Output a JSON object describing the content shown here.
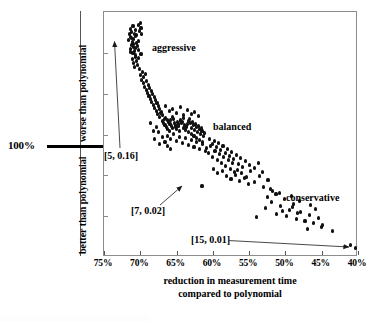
{
  "chart_data": {
    "type": "scatter",
    "title": "",
    "xlabel": "reduction in measurement time compared to polynomial",
    "ylabel_upper": "worse than polynomial",
    "ylabel_lower": "better than polynomial",
    "xlabel_line1": "reduction in measurement time",
    "xlabel_line2": "compared to polynomial",
    "x_tick_labels": [
      "75%",
      "70%",
      "65%",
      "60%",
      "55%",
      "50%",
      "45%",
      "40%"
    ],
    "x_tick_values": [
      75,
      70,
      65,
      60,
      55,
      50,
      45,
      40
    ],
    "xlim": [
      75,
      40
    ],
    "x_axis_reversed": true,
    "y_reference_label": "100%",
    "y_reference_note": "thick horizontal rule marking the 100% (equal to polynomial) level",
    "grid": false,
    "legend": "none",
    "cluster_annotations": [
      {
        "label": "aggressive",
        "x": 68.5,
        "y_px": 47
      },
      {
        "label": "balanced",
        "x": 60.2,
        "y_px": 126
      },
      {
        "label": "conservative",
        "x": 46.0,
        "y_px": 197
      }
    ],
    "point_annotations": [
      {
        "label": "[5, 0.16]",
        "target_x": 71.3,
        "target_y_px": 40,
        "arrow": "up"
      },
      {
        "label": "[7, 0.02]",
        "target_x": 61.5,
        "target_y_px": 185,
        "arrow": "up-right"
      },
      {
        "label": "[15, 0.01]",
        "target_x": 40.3,
        "target_y_px": 247,
        "arrow": "right"
      }
    ],
    "series": [
      {
        "name": "configurations",
        "marker": "filled-circle",
        "color": "#111111",
        "points": [
          [
            71.4,
            28
          ],
          [
            71.2,
            31
          ],
          [
            71.0,
            25
          ],
          [
            70.8,
            33
          ],
          [
            71.3,
            36
          ],
          [
            70.6,
            29
          ],
          [
            71.5,
            33
          ],
          [
            70.9,
            38
          ],
          [
            71.1,
            41
          ],
          [
            70.7,
            35
          ],
          [
            71.6,
            39
          ],
          [
            70.5,
            42
          ],
          [
            71.2,
            44
          ],
          [
            70.9,
            46
          ],
          [
            71.4,
            48
          ],
          [
            70.4,
            45
          ],
          [
            70.8,
            50
          ],
          [
            71.0,
            52
          ],
          [
            70.6,
            54
          ],
          [
            71.3,
            51
          ],
          [
            70.3,
            49
          ],
          [
            70.7,
            56
          ],
          [
            71.1,
            58
          ],
          [
            70.5,
            60
          ],
          [
            70.2,
            57
          ],
          [
            70.9,
            62
          ],
          [
            70.4,
            64
          ],
          [
            70.8,
            66
          ],
          [
            71.0,
            43
          ],
          [
            70.6,
            47
          ],
          [
            71.2,
            37
          ],
          [
            70.5,
            34
          ],
          [
            70.1,
            30
          ],
          [
            69.9,
            27
          ],
          [
            70.3,
            24
          ],
          [
            70.0,
            22
          ],
          [
            69.8,
            33
          ],
          [
            70.2,
            40
          ],
          [
            69.9,
            53
          ],
          [
            70.1,
            68
          ],
          [
            69.7,
            71
          ],
          [
            70.0,
            74
          ],
          [
            69.5,
            76
          ],
          [
            69.8,
            79
          ],
          [
            69.3,
            73
          ],
          [
            69.6,
            82
          ],
          [
            69.1,
            80
          ],
          [
            69.4,
            86
          ],
          [
            68.9,
            84
          ],
          [
            69.2,
            89
          ],
          [
            68.7,
            87
          ],
          [
            69.0,
            92
          ],
          [
            68.5,
            90
          ],
          [
            68.8,
            95
          ],
          [
            68.3,
            93
          ],
          [
            68.6,
            98
          ],
          [
            68.1,
            96
          ],
          [
            68.4,
            101
          ],
          [
            67.9,
            99
          ],
          [
            68.2,
            104
          ],
          [
            67.7,
            102
          ],
          [
            68.0,
            107
          ],
          [
            67.5,
            105
          ],
          [
            67.8,
            110
          ],
          [
            67.3,
            108
          ],
          [
            67.6,
            113
          ],
          [
            67.1,
            111
          ],
          [
            67.4,
            116
          ],
          [
            66.9,
            114
          ],
          [
            67.2,
            112
          ],
          [
            66.7,
            118
          ],
          [
            67.0,
            120
          ],
          [
            66.5,
            117
          ],
          [
            66.8,
            122
          ],
          [
            66.3,
            119
          ],
          [
            66.6,
            124
          ],
          [
            66.1,
            121
          ],
          [
            66.4,
            126
          ],
          [
            65.9,
            123
          ],
          [
            66.2,
            128
          ],
          [
            65.7,
            125
          ],
          [
            66.0,
            130
          ],
          [
            65.5,
            127
          ],
          [
            65.8,
            119
          ],
          [
            65.3,
            122
          ],
          [
            65.6,
            116
          ],
          [
            65.1,
            124
          ],
          [
            65.4,
            118
          ],
          [
            64.9,
            121
          ],
          [
            65.2,
            126
          ],
          [
            64.7,
            123
          ],
          [
            65.0,
            128
          ],
          [
            64.5,
            120
          ],
          [
            64.8,
            125
          ],
          [
            64.3,
            122
          ],
          [
            64.6,
            130
          ],
          [
            64.1,
            127
          ],
          [
            64.4,
            119
          ],
          [
            63.9,
            124
          ],
          [
            64.2,
            121
          ],
          [
            63.7,
            126
          ],
          [
            64.0,
            117
          ],
          [
            63.5,
            123
          ],
          [
            63.8,
            129
          ],
          [
            63.3,
            120
          ],
          [
            63.6,
            125
          ],
          [
            63.1,
            122
          ],
          [
            63.4,
            131
          ],
          [
            62.9,
            127
          ],
          [
            63.2,
            118
          ],
          [
            62.7,
            124
          ],
          [
            63.0,
            133
          ],
          [
            62.5,
            129
          ],
          [
            62.8,
            121
          ],
          [
            62.3,
            126
          ],
          [
            62.6,
            135
          ],
          [
            62.1,
            131
          ],
          [
            62.4,
            123
          ],
          [
            61.9,
            128
          ],
          [
            62.2,
            137
          ],
          [
            61.7,
            133
          ],
          [
            62.0,
            125
          ],
          [
            61.5,
            130
          ],
          [
            61.8,
            139
          ],
          [
            61.3,
            135
          ],
          [
            61.6,
            127
          ],
          [
            61.1,
            132
          ],
          [
            61.4,
            141
          ],
          [
            66.5,
            105
          ],
          [
            66.0,
            110
          ],
          [
            65.5,
            108
          ],
          [
            65.0,
            112
          ],
          [
            64.5,
            106
          ],
          [
            64.0,
            114
          ],
          [
            63.5,
            109
          ],
          [
            63.0,
            113
          ],
          [
            62.5,
            111
          ],
          [
            62.0,
            115
          ],
          [
            66.2,
            135
          ],
          [
            65.8,
            138
          ],
          [
            65.4,
            133
          ],
          [
            65.0,
            140
          ],
          [
            64.6,
            136
          ],
          [
            64.2,
            142
          ],
          [
            63.8,
            137
          ],
          [
            63.4,
            144
          ],
          [
            63.0,
            139
          ],
          [
            62.6,
            146
          ],
          [
            62.2,
            141
          ],
          [
            61.8,
            148
          ],
          [
            61.4,
            143
          ],
          [
            61.0,
            150
          ],
          [
            67.5,
            131
          ],
          [
            67.0,
            136
          ],
          [
            66.6,
            141
          ],
          [
            66.2,
            145
          ],
          [
            65.8,
            148
          ],
          [
            67.8,
            126
          ],
          [
            68.2,
            130
          ],
          [
            68.6,
            122
          ],
          [
            68.0,
            138
          ],
          [
            67.4,
            143
          ],
          [
            60.9,
            147
          ],
          [
            60.6,
            152
          ],
          [
            60.3,
            145
          ],
          [
            60.0,
            156
          ],
          [
            59.7,
            150
          ],
          [
            59.4,
            159
          ],
          [
            59.1,
            153
          ],
          [
            58.8,
            162
          ],
          [
            58.5,
            156
          ],
          [
            58.2,
            165
          ],
          [
            57.9,
            159
          ],
          [
            57.6,
            168
          ],
          [
            57.3,
            162
          ],
          [
            57.0,
            171
          ],
          [
            60.4,
            138
          ],
          [
            60.1,
            143
          ],
          [
            59.8,
            140
          ],
          [
            59.5,
            146
          ],
          [
            59.2,
            142
          ],
          [
            58.9,
            149
          ],
          [
            58.6,
            145
          ],
          [
            58.3,
            152
          ],
          [
            58.0,
            148
          ],
          [
            57.7,
            155
          ],
          [
            57.4,
            151
          ],
          [
            57.1,
            158
          ],
          [
            56.8,
            154
          ],
          [
            56.5,
            163
          ],
          [
            56.2,
            157
          ],
          [
            55.9,
            166
          ],
          [
            61.5,
            185
          ],
          [
            59.9,
            168
          ],
          [
            59.3,
            172
          ],
          [
            58.7,
            170
          ],
          [
            58.1,
            175
          ],
          [
            57.5,
            178
          ],
          [
            56.9,
            174
          ],
          [
            56.3,
            180
          ],
          [
            55.7,
            177
          ],
          [
            55.1,
            183
          ],
          [
            56.6,
            169
          ],
          [
            56.0,
            172
          ],
          [
            55.4,
            176
          ],
          [
            54.8,
            170
          ],
          [
            54.2,
            181
          ],
          [
            53.6,
            175
          ],
          [
            53.0,
            186
          ],
          [
            52.4,
            179
          ],
          [
            51.8,
            190
          ],
          [
            55.5,
            160
          ],
          [
            54.9,
            164
          ],
          [
            54.3,
            167
          ],
          [
            53.7,
            162
          ],
          [
            53.1,
            171
          ],
          [
            52.5,
            196
          ],
          [
            51.9,
            201
          ],
          [
            51.3,
            193
          ],
          [
            50.7,
            205
          ],
          [
            50.1,
            198
          ],
          [
            49.5,
            209
          ],
          [
            48.9,
            203
          ],
          [
            48.3,
            212
          ],
          [
            54.0,
            216
          ],
          [
            52.8,
            207
          ],
          [
            51.2,
            213
          ],
          [
            50.4,
            210
          ],
          [
            49.8,
            215
          ],
          [
            49.0,
            206
          ],
          [
            48.5,
            218
          ],
          [
            47.9,
            211
          ],
          [
            47.3,
            220
          ],
          [
            46.7,
            214
          ],
          [
            46.1,
            222
          ],
          [
            45.5,
            217
          ],
          [
            44.9,
            224
          ],
          [
            47.0,
            228
          ],
          [
            45.0,
            226
          ],
          [
            43.5,
            230
          ],
          [
            40.3,
            247
          ],
          [
            41.0,
            244
          ],
          [
            52.0,
            188
          ],
          [
            50.8,
            192
          ],
          [
            49.2,
            195
          ],
          [
            48.0,
            200
          ],
          [
            46.5,
            204
          ],
          [
            45.8,
            208
          ]
        ]
      }
    ],
    "n_points": 250,
    "y_axis_note": "y axis is unlabeled numerically; only the 100% reference level is marked"
  },
  "axis": {
    "x_ticks": [
      "75%",
      "70%",
      "65%",
      "60%",
      "55%",
      "50%",
      "45%",
      "40%"
    ],
    "x_title_line1": "reduction in measurement time",
    "x_title_line2": "compared to polynomial",
    "y_upper": "worse than polynomial",
    "y_lower": "better than polynomial",
    "hundred_percent": "100%"
  },
  "clusters": {
    "aggressive": "aggressive",
    "balanced": "balanced",
    "conservative": "conservative"
  },
  "annotations": {
    "a": "[5, 0.16]",
    "b": "[7, 0.02]",
    "c": "[15, 0.01]"
  },
  "colors": {
    "point": "#111111",
    "frame": "#8d8d8d",
    "text": "#000000",
    "background": "#ffffff"
  }
}
